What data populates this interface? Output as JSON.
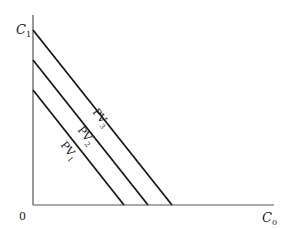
{
  "diagram": {
    "type": "present-value-lines",
    "y_axis_label": "C",
    "y_axis_subscript": "1",
    "x_axis_label": "C",
    "x_axis_subscript": "0",
    "origin_label": "0",
    "lines": [
      {
        "label": "PV",
        "subscript": "1"
      },
      {
        "label": "PV",
        "subscript": "2"
      },
      {
        "label": "PV",
        "subscript": "3"
      }
    ],
    "colors": {
      "axis": "#555555",
      "line": "#1a1a1a",
      "text": "#222222"
    }
  }
}
